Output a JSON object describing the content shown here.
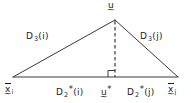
{
  "figure": {
    "type": "geometry-diagram",
    "stroke_color": "#3a3a3a",
    "text_color": "#1b1b1b",
    "background_color": "#ffffff"
  },
  "labels": {
    "apex": {
      "name": "apex-vertex-label",
      "base": "u",
      "accent": "under-tilde",
      "star": "",
      "subscript": ""
    },
    "left_diagonal": {
      "name": "left-side-length-label",
      "symbol": "D",
      "subscript": "3",
      "star": "",
      "argument": "(i)"
    },
    "right_diagonal": {
      "name": "right-side-length-label",
      "symbol": "D",
      "subscript": "3",
      "star": "",
      "argument": "(j)"
    },
    "base_left_segment": {
      "name": "left-base-segment-label",
      "symbol": "D",
      "subscript": "2",
      "star": "*",
      "argument": "(i)"
    },
    "base_right_segment": {
      "name": "right-base-segment-label",
      "symbol": "D",
      "subscript": "2",
      "star": "*",
      "argument": "(j)"
    },
    "foot": {
      "name": "perpendicular-foot-label",
      "base": "u",
      "accent": "under-tilde",
      "star": "*",
      "subscript": ""
    },
    "left_vertex": {
      "name": "left-base-vertex-label",
      "base": "x",
      "accent": "under-tilde-over-bar",
      "star": "",
      "subscript": "i"
    },
    "right_vertex": {
      "name": "right-base-vertex-label",
      "base": "x",
      "accent": "under-tilde-over-bar",
      "star": "",
      "subscript": "j"
    }
  },
  "geometry": {
    "apex": {
      "x": 115,
      "y": 20
    },
    "base_left": {
      "x": 13,
      "y": 77
    },
    "base_right": {
      "x": 178,
      "y": 77
    },
    "foot": {
      "x": 115,
      "y": 77
    },
    "right_angle_marker": {
      "size": 7
    },
    "perpendicular_style": "dashed"
  }
}
